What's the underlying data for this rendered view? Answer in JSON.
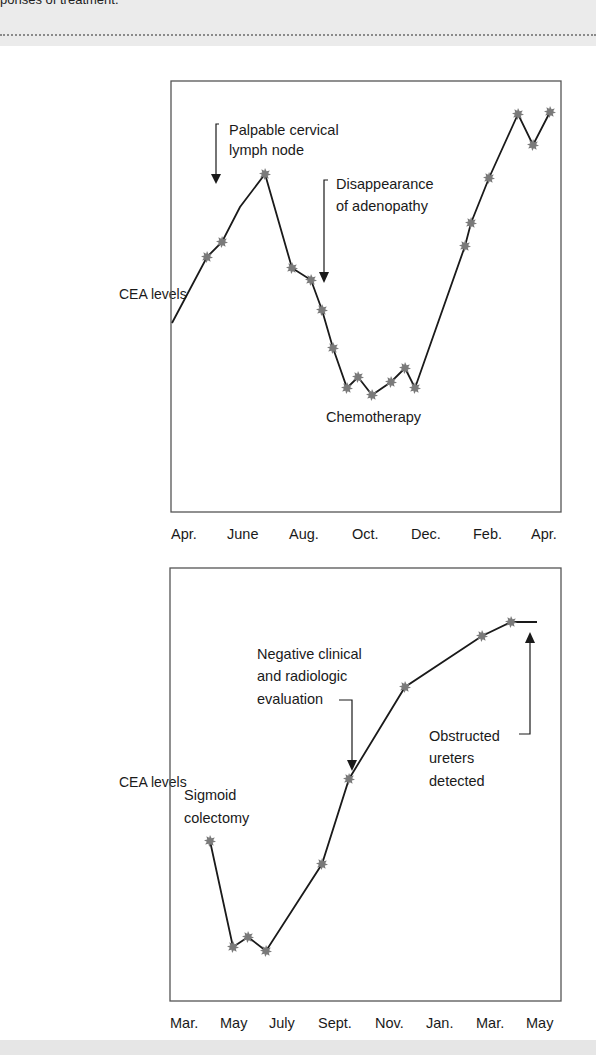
{
  "header": {
    "caption_fragment": "ponses of treatment."
  },
  "chart_data": [
    {
      "type": "line",
      "title": "",
      "ylabel": "CEA levels",
      "xlabel": "",
      "grid": false,
      "x_ticks": [
        "Apr.",
        "June",
        "Aug.",
        "Oct.",
        "Dec.",
        "Feb.",
        "Apr."
      ],
      "y_ticks": [],
      "series": [
        {
          "name": "CEA levels",
          "marker": "star",
          "points_px": [
            {
              "x": 172,
              "y": 323,
              "marker": false
            },
            {
              "x": 207,
              "y": 257,
              "marker": true
            },
            {
              "x": 222,
              "y": 242,
              "marker": true
            },
            {
              "x": 240,
              "y": 207,
              "marker": false
            },
            {
              "x": 265,
              "y": 174,
              "marker": true
            },
            {
              "x": 292,
              "y": 268,
              "marker": true
            },
            {
              "x": 311,
              "y": 280,
              "marker": true
            },
            {
              "x": 322,
              "y": 310,
              "marker": true
            },
            {
              "x": 333,
              "y": 348,
              "marker": true
            },
            {
              "x": 347,
              "y": 388,
              "marker": true
            },
            {
              "x": 358,
              "y": 377,
              "marker": true
            },
            {
              "x": 372,
              "y": 395,
              "marker": true
            },
            {
              "x": 391,
              "y": 382,
              "marker": true
            },
            {
              "x": 405,
              "y": 368,
              "marker": true
            },
            {
              "x": 415,
              "y": 388,
              "marker": true
            },
            {
              "x": 465,
              "y": 246,
              "marker": true
            },
            {
              "x": 471,
              "y": 223,
              "marker": true
            },
            {
              "x": 489,
              "y": 178,
              "marker": true
            },
            {
              "x": 518,
              "y": 114,
              "marker": true
            },
            {
              "x": 533,
              "y": 145,
              "marker": true
            },
            {
              "x": 550,
              "y": 112,
              "marker": true
            }
          ]
        }
      ],
      "annotations": [
        {
          "lines": [
            "Palpable cervical",
            "lymph node"
          ],
          "arrow": "down"
        },
        {
          "lines": [
            "Disappearance",
            "of adenopathy"
          ],
          "arrow": "down"
        },
        {
          "lines": [
            "Chemotherapy"
          ],
          "arrow": "none"
        }
      ]
    },
    {
      "type": "line",
      "title": "",
      "ylabel": "CEA levels",
      "xlabel": "",
      "grid": false,
      "x_ticks": [
        "Mar.",
        "May",
        "July",
        "Sept.",
        "Nov.",
        "Jan.",
        "Mar.",
        "May"
      ],
      "y_ticks": [],
      "series": [
        {
          "name": "CEA levels",
          "marker": "star",
          "points_px": [
            {
              "x": 210,
              "y": 841,
              "marker": true
            },
            {
              "x": 233,
              "y": 947,
              "marker": true
            },
            {
              "x": 248,
              "y": 937,
              "marker": true
            },
            {
              "x": 266,
              "y": 951,
              "marker": true
            },
            {
              "x": 322,
              "y": 864,
              "marker": true
            },
            {
              "x": 349,
              "y": 779,
              "marker": true
            },
            {
              "x": 405,
              "y": 687,
              "marker": true
            },
            {
              "x": 482,
              "y": 636,
              "marker": true
            },
            {
              "x": 511,
              "y": 622,
              "marker": true
            },
            {
              "x": 537,
              "y": 622,
              "marker": false
            }
          ]
        }
      ],
      "annotations": [
        {
          "lines": [
            "Negative clinical",
            "and radiologic",
            "evaluation"
          ],
          "arrow": "down"
        },
        {
          "lines": [
            "Obstructed",
            "ureters",
            "detected"
          ],
          "arrow": "up"
        },
        {
          "lines": [
            "Sigmoid",
            "colectomy"
          ],
          "arrow": "none"
        }
      ]
    }
  ],
  "colors": {
    "line": "#1a1a1a",
    "marker": "#7a7a7a",
    "frame": "#555555",
    "band": "#ebebeb"
  }
}
